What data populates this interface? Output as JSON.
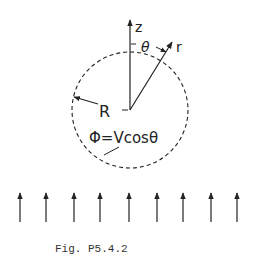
{
  "figure": {
    "caption": "Fig. P5.4.2",
    "labels": {
      "z_axis": "z",
      "r_axis": "r",
      "angle": "θ",
      "radius": "R",
      "potential": "Φ=Vcosθ"
    },
    "circle": {
      "cx": 130,
      "cy": 110,
      "r": 58,
      "style": "dashed"
    },
    "field_arrows": {
      "count": 9,
      "x_positions": [
        20,
        46,
        74,
        100,
        129,
        157,
        183,
        211,
        237
      ],
      "y_top": 193,
      "y_bottom": 222,
      "direction": "up"
    },
    "colors": {
      "ink": "#222222",
      "background": "#ffffff"
    }
  }
}
